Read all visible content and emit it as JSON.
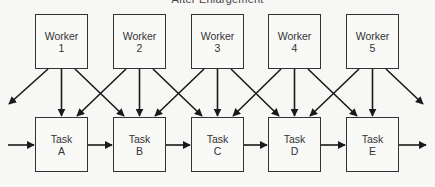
{
  "title": "After Enlargement",
  "workers": [
    {
      "label": "Worker",
      "id": "1",
      "x": 35
    },
    {
      "label": "Worker",
      "id": "2",
      "x": 113
    },
    {
      "label": "Worker",
      "id": "3",
      "x": 191
    },
    {
      "label": "Worker",
      "id": "4",
      "x": 268
    },
    {
      "label": "Worker",
      "id": "5",
      "x": 346
    }
  ],
  "tasks": [
    {
      "label": "Task",
      "id": "A",
      "x": 35
    },
    {
      "label": "Task",
      "id": "B",
      "x": 113
    },
    {
      "label": "Task",
      "id": "C",
      "x": 191
    },
    {
      "label": "Task",
      "id": "D",
      "x": 268
    },
    {
      "label": "Task",
      "id": "E",
      "x": 346
    }
  ],
  "layout": {
    "worker_top": 14,
    "task_top": 117,
    "box_width": 53,
    "box_height": 55,
    "flow_y": 145,
    "line_color": "#1a1a1a"
  }
}
